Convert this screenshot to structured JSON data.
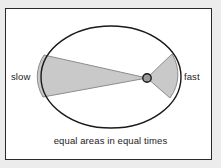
{
  "figure": {
    "name": "keplers-second-law-diagram",
    "caption": "equal areas in equal times",
    "labels": {
      "left": "slow",
      "right": "fast"
    },
    "colors": {
      "page_background": "#ececec",
      "panel_background": "#ffffff",
      "frame_border": "#2a2a2a",
      "orbit_stroke": "#1a1a1a",
      "sector_fill": "#c9c9c9",
      "sector_stroke": "#8c8c8c",
      "focus_fill": "#9a9a9a",
      "focus_stroke": "#1a1a1a",
      "text": "#1c1c1c"
    },
    "geometry": {
      "ellipse_center_x": 111,
      "ellipse_center_y": 77,
      "ellipse_radius_x": 70,
      "ellipse_radius_y": 51,
      "focus_x": 147,
      "focus_y": 78,
      "focus_radius": 4.2,
      "slow_sector_top_x": 44,
      "slow_sector_top_y": 55,
      "slow_sector_bottom_x": 43,
      "slow_sector_bottom_y": 97,
      "fast_sector_top_x": 172,
      "fast_sector_top_y": 54,
      "fast_sector_bottom_x": 170,
      "fast_sector_bottom_y": 98
    }
  }
}
